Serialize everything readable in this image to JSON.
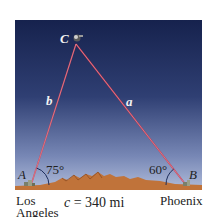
{
  "figure": {
    "vertices": {
      "A": {
        "label": "A",
        "city": [
          "Los",
          "Angeles"
        ]
      },
      "B": {
        "label": "B",
        "city": "Phoenix"
      },
      "C": {
        "label": "C"
      }
    },
    "sides": {
      "a": "a",
      "b": "b",
      "c": "c = 340 mi"
    },
    "angles": {
      "A": "75°",
      "B": "60°"
    },
    "colors": {
      "sky_top": "#16224d",
      "sky_bottom": "#aab6d6",
      "ground": "#c0733a",
      "side_lines": "#c8334a",
      "angle_arcs": "#1d2d5a"
    }
  }
}
